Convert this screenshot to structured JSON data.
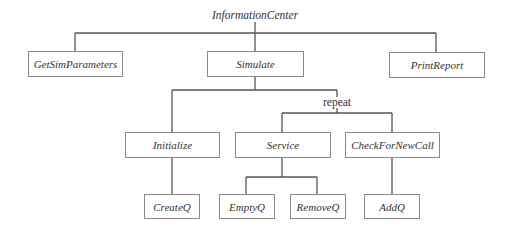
{
  "diagram": {
    "type": "structure-chart",
    "root": {
      "label": "InformationCenter"
    },
    "level1": [
      {
        "label": "GetSimParameters"
      },
      {
        "label": "Simulate"
      },
      {
        "label": "PrintReport"
      }
    ],
    "level2": [
      {
        "label": "Initialize",
        "parent": "Simulate"
      },
      {
        "label": "Service",
        "parent": "Simulate"
      },
      {
        "label": "CheckForNewCall",
        "parent": "Simulate"
      }
    ],
    "level3": [
      {
        "label": "CreateQ",
        "parent": "Initialize"
      },
      {
        "label": "EmptyQ",
        "parent": "Service"
      },
      {
        "label": "RemoveQ",
        "parent": "Service"
      },
      {
        "label": "AddQ",
        "parent": "CheckForNewCall"
      }
    ],
    "annotations": {
      "repeat": "repeat"
    },
    "colors": {
      "line": "#555555",
      "box_border": "#8a8a8a",
      "text": "#333333"
    }
  }
}
